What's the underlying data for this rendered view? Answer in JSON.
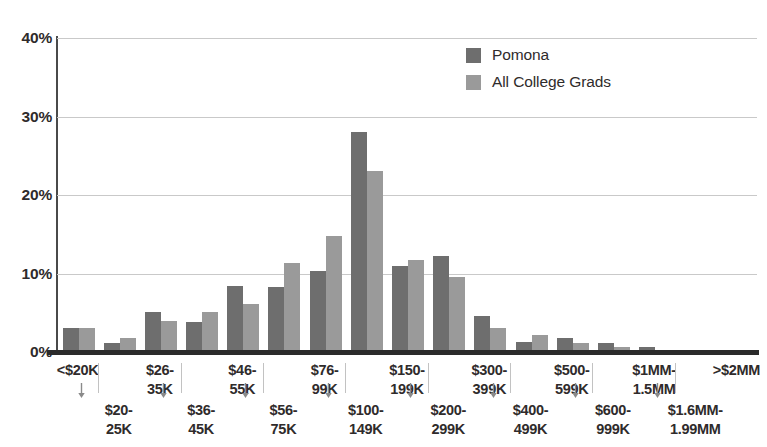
{
  "chart_data": {
    "type": "bar",
    "title": "",
    "subtitle": "",
    "xlabel": "",
    "ylabel": "",
    "ylim": [
      0,
      40
    ],
    "yticks": [
      0,
      10,
      20,
      30,
      40
    ],
    "ytick_labels": [
      "0%",
      "10%",
      "20%",
      "30%",
      "40%"
    ],
    "grid": "horizontal",
    "legend_position": "top-right",
    "categories": [
      "<$20K",
      "$20-25K",
      "$26-35K",
      "$36-45K",
      "$46-55K",
      "$56-75K",
      "$76-99K",
      "$100-149K",
      "$150-199K",
      "$200-299K",
      "$300-399K",
      "$400-499K",
      "$500-599K",
      "$600-999K",
      "$1MM-1.5MM",
      "$1.6MM-1.99MM",
      ">$2MM"
    ],
    "category_labels_display": [
      {
        "line1": "<$20K",
        "line2": "",
        "row": "top"
      },
      {
        "line1": "$20-",
        "line2": "25K",
        "row": "bottom"
      },
      {
        "line1": "$26-",
        "line2": "35K",
        "row": "top"
      },
      {
        "line1": "$36-",
        "line2": "45K",
        "row": "bottom"
      },
      {
        "line1": "$46-",
        "line2": "55K",
        "row": "top"
      },
      {
        "line1": "$56-",
        "line2": "75K",
        "row": "bottom"
      },
      {
        "line1": "$76-",
        "line2": "99K",
        "row": "top"
      },
      {
        "line1": "$100-",
        "line2": "149K",
        "row": "bottom"
      },
      {
        "line1": "$150-",
        "line2": "199K",
        "row": "top"
      },
      {
        "line1": "$200-",
        "line2": "299K",
        "row": "bottom"
      },
      {
        "line1": "$300-",
        "line2": "399K",
        "row": "top"
      },
      {
        "line1": "$400-",
        "line2": "499K",
        "row": "bottom"
      },
      {
        "line1": "$500-",
        "line2": "599K",
        "row": "top"
      },
      {
        "line1": "$600-",
        "line2": "999K",
        "row": "bottom"
      },
      {
        "line1": "$1MM-",
        "line2": "1.5MM",
        "row": "top"
      },
      {
        "line1": "$1.6MM-",
        "line2": "1.99MM",
        "row": "bottom"
      },
      {
        "line1": ">$2MM",
        "line2": "",
        "row": "top"
      }
    ],
    "series": [
      {
        "name": "Pomona",
        "color": "#6e6e6e",
        "values": [
          3.0,
          1.2,
          5.1,
          3.8,
          8.4,
          8.3,
          10.3,
          28.0,
          11.0,
          12.2,
          4.6,
          1.3,
          1.8,
          1.1,
          0.6,
          0.2,
          0.2
        ]
      },
      {
        "name": "All College Grads",
        "color": "#9a9a9a",
        "values": [
          3.0,
          1.8,
          3.9,
          5.1,
          6.1,
          11.3,
          14.8,
          23.1,
          11.7,
          9.5,
          3.0,
          2.2,
          1.1,
          0.6,
          0.3,
          0.2,
          0.2
        ]
      }
    ]
  },
  "legend": {
    "items": [
      {
        "label": "Pomona",
        "color": "#6e6e6e"
      },
      {
        "label": "All College Grads",
        "color": "#9a9a9a"
      }
    ]
  }
}
